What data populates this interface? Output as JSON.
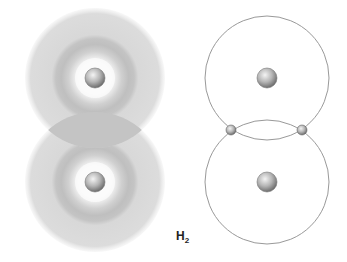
{
  "diagram": {
    "label": {
      "main": "H",
      "subscript": "2"
    },
    "left_model": {
      "name": "electron-cloud-model",
      "atoms": [
        {
          "cx": 95,
          "cy": 78
        },
        {
          "cx": 95,
          "cy": 182
        }
      ],
      "colors": {
        "outer_cloud": "#d9d9d9",
        "inner_ring": "#bcbcbc",
        "overlap": "#c4c4c4",
        "nucleus": "#9a9a9a"
      }
    },
    "right_model": {
      "name": "orbit-model",
      "atoms": [
        {
          "cx": 267,
          "cy": 78
        },
        {
          "cx": 267,
          "cy": 182
        }
      ],
      "electrons": [
        {
          "cx": 231,
          "cy": 130
        },
        {
          "cx": 302,
          "cy": 130
        }
      ],
      "colors": {
        "orbit_line": "#999999"
      }
    }
  }
}
